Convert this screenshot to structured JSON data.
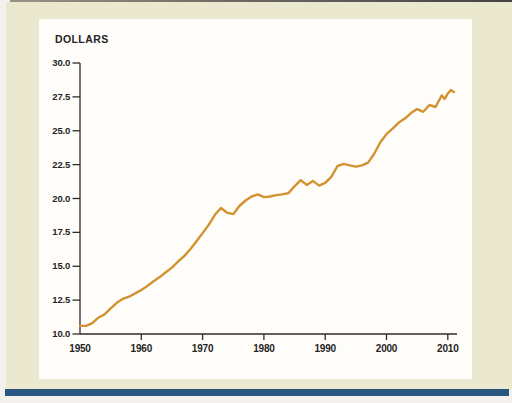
{
  "figure": {
    "unit_label": "DOLLARS"
  },
  "colors": {
    "page_bg": "#f2f1ed",
    "figure_bg": "#ebe8d0",
    "panel_bg": "#fefdfa",
    "top_rule_left": "#9a9286",
    "top_rule_right": "#454246",
    "bottom_rule": "#2a5580",
    "axis": "#2e2c29",
    "text": "#262422",
    "line": "#d2922e"
  },
  "chart_data": {
    "type": "line",
    "title": "",
    "xlabel": "",
    "ylabel": "DOLLARS",
    "grid": false,
    "legend": "none",
    "xlim": [
      1950,
      2012
    ],
    "ylim": [
      10.0,
      30.0
    ],
    "x_ticks": {
      "values": [
        1950,
        1960,
        1970,
        1980,
        1990,
        2000,
        2010
      ],
      "labels": [
        "1950",
        "1960",
        "1970",
        "1980",
        "1990",
        "2000",
        "2010"
      ]
    },
    "y_ticks": {
      "values": [
        30.0,
        27.5,
        25.0,
        22.5,
        20.0,
        17.5,
        15.0,
        12.5,
        10.0
      ],
      "labels": [
        "30.0",
        "27.5",
        "25.0",
        "22.5",
        "20.0",
        "17.5",
        "15.0",
        "12.5",
        "10.0"
      ]
    },
    "series": [
      {
        "name": "dollars",
        "color": "#d2922e",
        "x": [
          1950,
          1951,
          1952,
          1953,
          1954,
          1955,
          1956,
          1957,
          1958,
          1959,
          1960,
          1961,
          1962,
          1963,
          1964,
          1965,
          1966,
          1967,
          1968,
          1969,
          1970,
          1971,
          1972,
          1973,
          1974,
          1975,
          1976,
          1977,
          1978,
          1979,
          1980,
          1981,
          1982,
          1983,
          1984,
          1985,
          1986,
          1987,
          1988,
          1989,
          1990,
          1991,
          1992,
          1993,
          1994,
          1995,
          1996,
          1997,
          1998,
          1999,
          2000,
          2001,
          2002,
          2003,
          2004,
          2005,
          2006,
          2007,
          2008,
          2009,
          2009.5,
          2010,
          2010.5,
          2011
        ],
        "values": [
          10.6,
          10.6,
          10.8,
          11.2,
          11.45,
          11.9,
          12.3,
          12.6,
          12.75,
          13.0,
          13.25,
          13.55,
          13.9,
          14.2,
          14.55,
          14.9,
          15.35,
          15.75,
          16.25,
          16.85,
          17.45,
          18.05,
          18.8,
          19.3,
          18.95,
          18.85,
          19.45,
          19.85,
          20.15,
          20.3,
          20.1,
          20.15,
          20.25,
          20.3,
          20.4,
          20.9,
          21.35,
          21.0,
          21.3,
          20.95,
          21.15,
          21.6,
          22.4,
          22.55,
          22.45,
          22.35,
          22.45,
          22.65,
          23.3,
          24.15,
          24.75,
          25.15,
          25.6,
          25.9,
          26.3,
          26.6,
          26.4,
          26.9,
          26.75,
          27.6,
          27.35,
          27.75,
          28.0,
          27.85
        ]
      }
    ]
  }
}
